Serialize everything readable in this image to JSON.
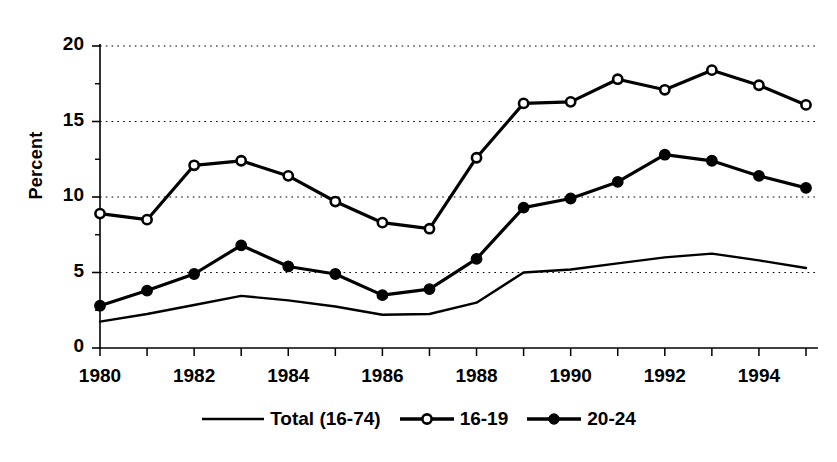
{
  "chart_data": {
    "type": "line",
    "title": "",
    "xlabel": "",
    "ylabel": "Percent",
    "ylim": [
      0,
      20
    ],
    "xlim": [
      1980,
      1995
    ],
    "grid": true,
    "gridlines_y": [
      5,
      10,
      15,
      20
    ],
    "legend_position": "bottom",
    "x": [
      1980,
      1981,
      1982,
      1983,
      1984,
      1985,
      1986,
      1987,
      1988,
      1989,
      1990,
      1991,
      1992,
      1993,
      1994,
      1995
    ],
    "x_tick_labels": [
      "1980",
      "1982",
      "1984",
      "1986",
      "1988",
      "1990",
      "1992",
      "1994"
    ],
    "x_tick_values": [
      1980,
      1982,
      1984,
      1986,
      1988,
      1990,
      1992,
      1994
    ],
    "y_tick_labels": [
      "0",
      "5",
      "10",
      "15",
      "20"
    ],
    "y_tick_values": [
      0,
      5,
      10,
      15,
      20
    ],
    "series": [
      {
        "name": "Total (16-74)",
        "marker": "none",
        "color": "#000000",
        "values": [
          1.75,
          2.25,
          2.85,
          3.45,
          3.15,
          2.75,
          2.2,
          2.25,
          3.0,
          5.0,
          5.2,
          5.6,
          6.0,
          6.25,
          5.8,
          5.3
        ]
      },
      {
        "name": "16-19",
        "marker": "open-circle",
        "color": "#000000",
        "values": [
          8.9,
          8.5,
          12.1,
          12.4,
          11.4,
          9.7,
          8.3,
          7.9,
          12.6,
          16.2,
          16.3,
          17.8,
          17.1,
          18.4,
          17.4,
          16.1
        ]
      },
      {
        "name": "20-24",
        "marker": "filled-circle",
        "color": "#000000",
        "values": [
          2.8,
          3.8,
          4.9,
          6.8,
          5.4,
          4.9,
          3.5,
          3.9,
          5.9,
          9.3,
          9.9,
          11.0,
          12.8,
          12.4,
          11.4,
          10.6
        ]
      }
    ]
  },
  "axis": {
    "y_title": "Percent"
  },
  "legend": {
    "items": [
      {
        "label": "Total (16-74)",
        "marker": "none"
      },
      {
        "label": "16-19",
        "marker": "open-circle"
      },
      {
        "label": "20-24",
        "marker": "filled-circle"
      }
    ]
  }
}
